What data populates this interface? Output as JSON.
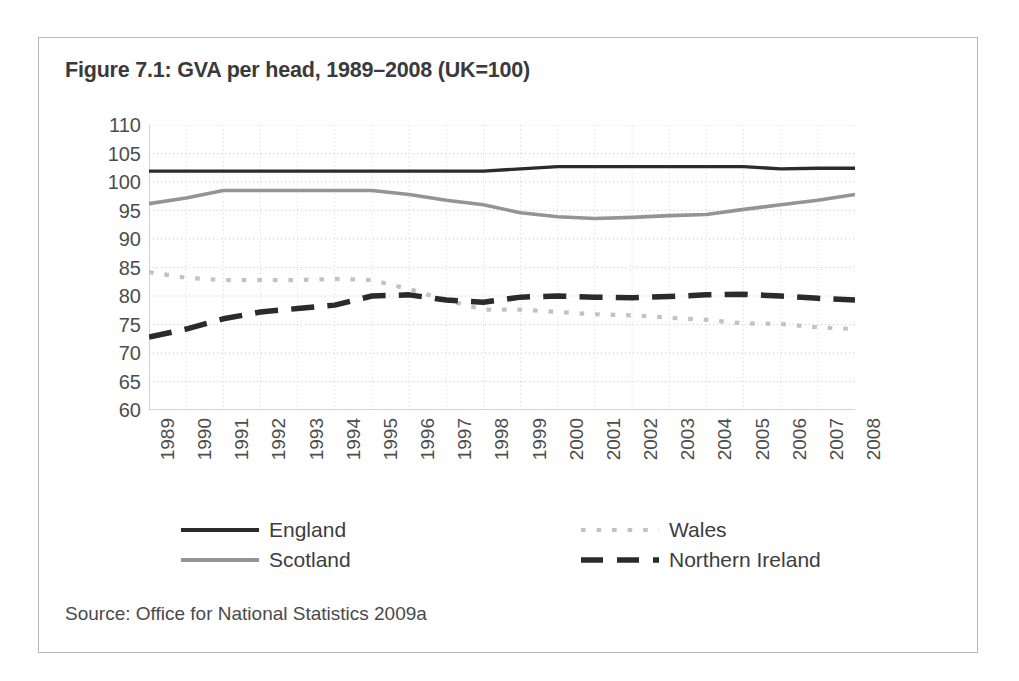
{
  "figure": {
    "title": "Figure 7.1: GVA per head, 1989–2008 (UK=100)",
    "source": "Source: Office for National Statistics 2009a",
    "frame_color": "#b9b9b9"
  },
  "legend": {
    "position": "below-plot",
    "entries": [
      {
        "label": "England",
        "style": "solid",
        "color": "#2b2b2b",
        "key": "legend-key-england"
      },
      {
        "label": "Scotland",
        "style": "solid",
        "color": "#949494",
        "key": "legend-key-scotland"
      },
      {
        "label": "Wales",
        "style": "dotted",
        "color": "#c2c2c2",
        "key": "legend-key-wales"
      },
      {
        "label": "Northern Ireland",
        "style": "dashed",
        "color": "#2b2b2b",
        "key": "legend-key-northern-ireland"
      }
    ]
  },
  "chart_data": {
    "type": "line",
    "title": "Figure 7.1: GVA per head, 1989–2008 (UK=100)",
    "xlabel": "",
    "ylabel": "",
    "ylim": [
      60,
      110
    ],
    "yticks": [
      60,
      65,
      70,
      75,
      80,
      85,
      90,
      95,
      100,
      105,
      110
    ],
    "grid": true,
    "legend_position": "bottom",
    "categories": [
      "1989",
      "1990",
      "1991",
      "1992",
      "1993",
      "1994",
      "1995",
      "1996",
      "1997",
      "1998",
      "1999",
      "2000",
      "2001",
      "2002",
      "2003",
      "2004",
      "2005",
      "2006",
      "2007",
      "2008"
    ],
    "series": [
      {
        "name": "England",
        "color": "#2b2b2b",
        "style": "solid",
        "values": [
          101.9,
          101.9,
          101.9,
          101.9,
          101.9,
          101.9,
          101.9,
          101.9,
          101.9,
          101.9,
          102.3,
          102.7,
          102.7,
          102.7,
          102.7,
          102.7,
          102.7,
          102.3,
          102.4,
          102.4
        ]
      },
      {
        "name": "Scotland",
        "color": "#949494",
        "style": "solid",
        "values": [
          96.2,
          97.2,
          98.5,
          98.5,
          98.5,
          98.5,
          98.5,
          97.8,
          96.8,
          96.0,
          94.6,
          93.9,
          93.6,
          93.8,
          94.1,
          94.3,
          95.2,
          96.0,
          96.8,
          97.8
        ]
      },
      {
        "name": "Wales",
        "color": "#c2c2c2",
        "style": "dotted",
        "values": [
          84.2,
          83.2,
          82.8,
          82.8,
          82.8,
          83.0,
          82.8,
          81.2,
          79.3,
          77.6,
          77.6,
          77.2,
          76.8,
          76.6,
          76.2,
          75.8,
          75.2,
          75.1,
          74.5,
          74.2
        ]
      },
      {
        "name": "Northern Ireland",
        "color": "#2b2b2b",
        "style": "dashed",
        "values": [
          72.8,
          74.2,
          76.0,
          77.2,
          77.8,
          78.4,
          80.0,
          80.2,
          79.3,
          78.9,
          79.8,
          80.0,
          79.8,
          79.7,
          79.9,
          80.2,
          80.3,
          80.0,
          79.6,
          79.3
        ]
      }
    ]
  }
}
